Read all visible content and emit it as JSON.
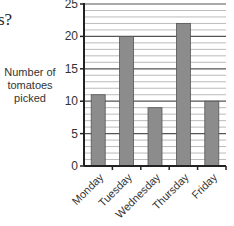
{
  "question_fragment": "s?",
  "chart_data": {
    "type": "bar",
    "title": "",
    "xlabel": "",
    "ylabel": "Number of tomatoes picked",
    "ylabel_lines": [
      "Number of",
      "tomatoes",
      "picked"
    ],
    "categories": [
      "Monday",
      "Tuesday",
      "Wednesday",
      "Thursday",
      "Friday"
    ],
    "values": [
      11,
      20,
      9,
      22,
      10
    ],
    "ylim": [
      0,
      25
    ],
    "yticks": [
      0,
      5,
      10,
      15,
      20,
      25
    ],
    "grid": {
      "major_every": 5,
      "minor_every": 1,
      "on": true
    },
    "legend": null,
    "bar_color": "#8c8c8c",
    "bar_edge_color": "#555555"
  }
}
